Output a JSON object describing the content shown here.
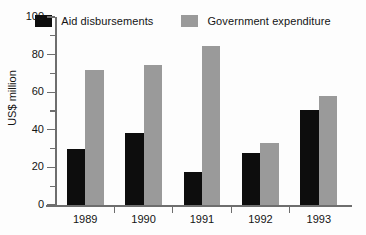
{
  "chart_data": {
    "type": "bar",
    "title": "",
    "subtitle": "",
    "xlabel": "",
    "ylabel": "US$ million",
    "categories": [
      "1989",
      "1990",
      "1991",
      "1992",
      "1993"
    ],
    "series": [
      {
        "name": "Aid disbursements",
        "color": "#0d0d0d",
        "values": [
          30,
          38.5,
          17.5,
          27.5,
          50.5
        ]
      },
      {
        "name": "Government expenditure",
        "color": "#9a9a9a",
        "values": [
          72,
          74.5,
          84.5,
          33,
          58
        ]
      }
    ],
    "ylim": [
      0,
      100
    ],
    "y_major_ticks": [
      0,
      20,
      40,
      60,
      80,
      100
    ],
    "y_minor_ticks": [
      10,
      30,
      50,
      70,
      90
    ],
    "y_tick_labels": [
      "0",
      "20",
      "40",
      "60",
      "80",
      "100"
    ],
    "grid": false,
    "legend_position": "top",
    "annotations": []
  },
  "legend": {
    "entries": [
      {
        "label": "Aid disbursements",
        "swatch": "black-swatch-icon"
      },
      {
        "label": "Government expenditure",
        "swatch": "gray-swatch-icon"
      }
    ]
  },
  "axes": {
    "y_title": "US$ million"
  },
  "colors": {
    "aid": "#0d0d0d",
    "government": "#9a9a9a",
    "axis": "#6e6e6e",
    "text": "#141414",
    "background": "#fdfdfd"
  }
}
